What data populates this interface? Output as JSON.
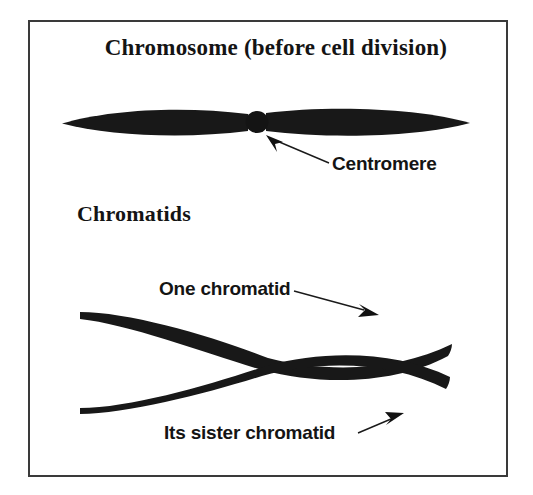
{
  "figure": {
    "title": "Chromosome (before cell division)",
    "section_heading": "Chromatids",
    "border_color": "#3a3a3a",
    "background_color": "#ffffff",
    "ink_color": "#141414"
  },
  "labels": {
    "centromere": "Centromere",
    "one_chromatid": "One chromatid",
    "sister_chromatid": "Its sister chromatid"
  },
  "diagram": {
    "chromosome": {
      "name": "single-chromosome",
      "left_arm": {
        "x1": 62,
        "x2": 246,
        "cy": 122,
        "half_height": 11
      },
      "right_arm": {
        "x1": 268,
        "x2": 470,
        "cy": 122,
        "half_height": 11
      },
      "centromere_knob": {
        "cx": 257,
        "cy": 122,
        "r": 11
      }
    },
    "chromatid_pair": {
      "name": "sister-chromatid-pair",
      "cross_center": {
        "x": 268,
        "y": 363
      },
      "chromatid_a": {
        "x1": 80,
        "y1": 313,
        "x2": 452,
        "y2": 345
      },
      "chromatid_b": {
        "x1": 80,
        "y1": 405,
        "x2": 448,
        "y2": 410
      }
    },
    "arrows": [
      {
        "name": "centromere-arrow",
        "from_x": 329,
        "from_y": 164,
        "to_x": 266,
        "to_y": 136
      },
      {
        "name": "one-chromatid-arrow",
        "from_x": 296,
        "from_y": 291,
        "to_x": 377,
        "to_y": 314
      },
      {
        "name": "sister-chromatid-arrow",
        "from_x": 359,
        "from_y": 433,
        "to_x": 402,
        "to_y": 414
      }
    ]
  }
}
